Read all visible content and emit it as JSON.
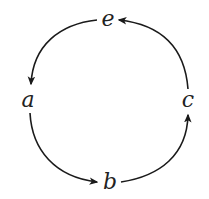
{
  "diagram": {
    "type": "directed-cycle",
    "nodes": [
      {
        "id": "e",
        "label": "e",
        "x": 108,
        "y": 20
      },
      {
        "id": "a",
        "label": "a",
        "x": 27,
        "y": 101
      },
      {
        "id": "c",
        "label": "c",
        "x": 188,
        "y": 101
      },
      {
        "id": "b",
        "label": "b",
        "x": 110,
        "y": 183
      }
    ],
    "edges": [
      {
        "from": "e",
        "to": "a"
      },
      {
        "from": "a",
        "to": "b"
      },
      {
        "from": "b",
        "to": "c"
      },
      {
        "from": "c",
        "to": "e"
      }
    ],
    "colors": {
      "stroke": "#1a1a1a",
      "label": "#222222",
      "background": "#ffffff"
    }
  }
}
